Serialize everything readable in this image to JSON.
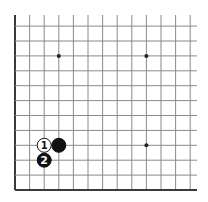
{
  "board": {
    "corner": "bottom-left",
    "visible_columns": 13,
    "visible_rows": 12,
    "origin_x": 15,
    "origin_y": 190,
    "spacing_x": 14.6,
    "spacing_y": 14.9,
    "line_color": "#8a8a8a",
    "edge_color": "#3a3a3a",
    "star_points": [
      {
        "col": 3,
        "row": 9
      },
      {
        "col": 9,
        "row": 9
      },
      {
        "col": 9,
        "row": 3
      }
    ]
  },
  "stones": [
    {
      "color": "black",
      "col": 3,
      "row": 3,
      "label": ""
    },
    {
      "color": "white",
      "col": 2,
      "row": 3,
      "label": "1"
    },
    {
      "color": "black",
      "col": 2,
      "row": 2,
      "label": "2"
    }
  ]
}
